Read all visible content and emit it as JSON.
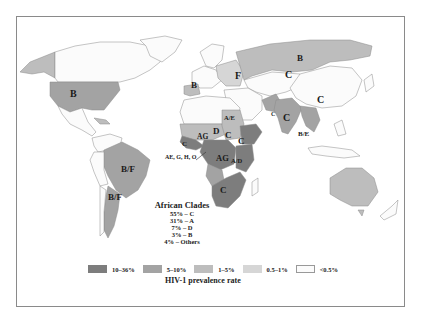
{
  "map": {
    "title": "HIV-1 prevalence rate",
    "colors": {
      "10-36": "#7d7d7d",
      "5-10": "#a3a3a3",
      "1-5": "#bdbdbd",
      "0.5-1": "#d6d6d6",
      "lt0.5": "#fbfbfb",
      "border": "#8a8a8a"
    },
    "region_labels": {
      "north_america": "B",
      "western_europe": "B",
      "eastern_europe": "F",
      "russia_north": "B",
      "russia_central": "C",
      "china": "C",
      "india": "C",
      "pakistan": "C",
      "southeast_asia": "B/E",
      "brazil": "B/F",
      "argentina": "B/F",
      "north_east_africa": "A/E",
      "sahel_west": "AG",
      "sudan_west": "D",
      "sudan_east": "C",
      "ethiopia": "C",
      "west_africa": "C",
      "central_africa": "AG",
      "east_africa": "A/D",
      "southern_africa": "C",
      "west_africa_callout": "AE, G, H, O"
    },
    "african_clades": {
      "title": "African Clades",
      "rows": [
        "55% – C",
        "31% – A",
        "7% – D",
        "3% – B",
        "4% – Others"
      ]
    },
    "legend": [
      {
        "label": "10–36%",
        "key": "10-36"
      },
      {
        "label": "5–10%",
        "key": "5-10"
      },
      {
        "label": "1–5%",
        "key": "1-5"
      },
      {
        "label": "0.5–1%",
        "key": "0.5-1"
      },
      {
        "label": "<0.5%",
        "key": "lt0.5"
      }
    ]
  }
}
